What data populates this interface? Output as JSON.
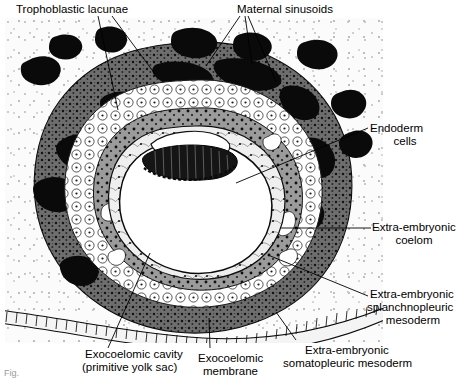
{
  "figure": {
    "type": "histological-cross-section",
    "caption_fragment": "Fig."
  },
  "labels": {
    "trophoblastic_lacunae": "Trophoblastic lacunae",
    "maternal_sinusoids": "Maternal sinusoids",
    "endoderm_cells_l1": "Endoderm",
    "endoderm_cells_l2": "cells",
    "exocoelom_l1": "Extra-embryonic",
    "exocoelom_l2": "coelom",
    "splanchnopleuric_l1": "Extra-embryonic",
    "splanchnopleuric_l2": "splanchnopleuric",
    "splanchnopleuric_l3": "mesoderm",
    "exocoelomic_cavity_l1": "Exocoelomic cavity",
    "exocoelomic_cavity_l2": "(primitive yolk sac)",
    "exocoelomic_membrane_l1": "Exocoelomic",
    "exocoelomic_membrane_l2": "membrane",
    "somatopleuric_l1": "Extra-embryonic",
    "somatopleuric_l2": "somatopleuric mesoderm"
  },
  "structures": [
    "endometrial stroma",
    "uterine surface epithelium",
    "syncytiotrophoblast",
    "cytotrophoblast",
    "trophoblastic lacunae",
    "maternal sinusoids",
    "extra-embryonic mesoderm",
    "extra-embryonic coelom",
    "exocoelomic membrane",
    "primitive yolk sac",
    "bilaminar embryonic disc",
    "amniotic cavity"
  ],
  "colors": {
    "ink": "#000000",
    "stroma": "#fbfbfb",
    "syncytium": "#4a4a4a",
    "cyto": "#ffffff",
    "mesoderm": "#8a8a8a",
    "lacuna": "#111111",
    "cavity": "#ffffff"
  }
}
